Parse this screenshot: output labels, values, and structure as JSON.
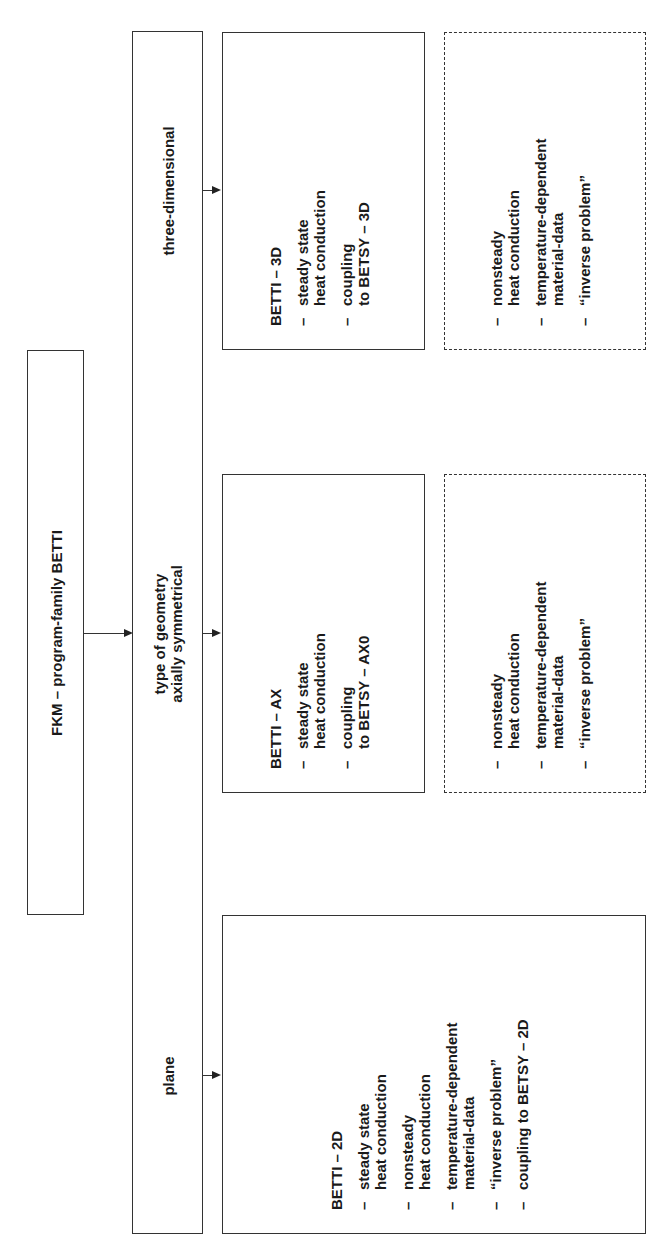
{
  "root": {
    "label": "FKM – program-family BETTI"
  },
  "geometry_column": {
    "three_dimensional": "three-dimensional",
    "type_of_geometry": "type of geometry",
    "axially_symmetrical": "axially symmetrical",
    "plane": "plane"
  },
  "betti_3d": {
    "title": "BETTI – 3D",
    "items": [
      "steady state\nheat conduction",
      "coupling\nto BETSY – 3D"
    ],
    "planned_items": [
      "nonsteady\nheat conduction",
      "temperature-dependent\nmaterial-data",
      "“inverse problem”"
    ]
  },
  "betti_ax": {
    "title": "BETTI – AX",
    "items": [
      "steady state\nheat conduction",
      "coupling\nto BETSY – AX0"
    ],
    "planned_items": [
      "nonsteady\nheat conduction",
      "temperature-dependent\nmaterial-data",
      "“inverse problem”"
    ]
  },
  "betti_2d": {
    "title": "BETTI – 2D",
    "items": [
      "steady state\nheat conduction",
      "nonsteady\nheat conduction",
      "temperature-dependent\nmaterial-data",
      "“inverse problem”",
      "coupling to BETSY – 2D"
    ]
  },
  "symbols": {
    "dash": "–"
  },
  "colors": {
    "line": "#333333",
    "text": "#1a1a1a",
    "background": "#ffffff"
  }
}
